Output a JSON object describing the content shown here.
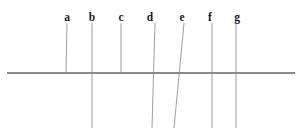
{
  "figure": {
    "type": "line-diagram",
    "width": 302,
    "height": 135,
    "background_color": "#ffffff",
    "title": ""
  },
  "chart_data": {
    "type": "diagram",
    "title": "",
    "xlabel": "",
    "ylabel": "",
    "grid": false,
    "legend": null,
    "axis": {
      "name": "horizontal-baseline",
      "orientation": "horizontal",
      "x_start": 7,
      "x_end": 295,
      "y": 73,
      "color": "#8a8a8a",
      "stroke_width": 1.6
    },
    "stem_color": "#a2a2a2",
    "stem_stroke_width": 1.05,
    "label_color": "#1b1b1b",
    "label_y": 12,
    "categories": [
      "a",
      "b",
      "c",
      "d",
      "e",
      "f",
      "g"
    ],
    "stems": [
      {
        "label": "a",
        "label_x": 67,
        "x_top": 67,
        "y_top": 23,
        "x_bottom": 66,
        "y_bottom": 73,
        "crosses_axis": false,
        "slant": "vertical"
      },
      {
        "label": "b",
        "label_x": 92,
        "x_top": 92,
        "y_top": 23,
        "x_bottom": 92,
        "y_bottom": 128,
        "crosses_axis": true,
        "slant": "vertical"
      },
      {
        "label": "c",
        "label_x": 121,
        "x_top": 121,
        "y_top": 23,
        "x_bottom": 121,
        "y_bottom": 73,
        "crosses_axis": false,
        "slant": "vertical"
      },
      {
        "label": "d",
        "label_x": 150,
        "x_top": 155,
        "y_top": 23,
        "x_bottom": 152,
        "y_bottom": 128,
        "crosses_axis": true,
        "slant": "slight-left"
      },
      {
        "label": "e",
        "label_x": 182,
        "x_top": 184,
        "y_top": 23,
        "x_bottom": 174,
        "y_bottom": 128,
        "crosses_axis": true,
        "slant": "left"
      },
      {
        "label": "f",
        "label_x": 210,
        "x_top": 212,
        "y_top": 23,
        "x_bottom": 212,
        "y_bottom": 128,
        "crosses_axis": true,
        "slant": "vertical"
      },
      {
        "label": "g",
        "label_x": 237,
        "x_top": 236,
        "y_top": 22,
        "x_bottom": 236,
        "y_bottom": 128,
        "crosses_axis": true,
        "slant": "vertical"
      }
    ]
  }
}
